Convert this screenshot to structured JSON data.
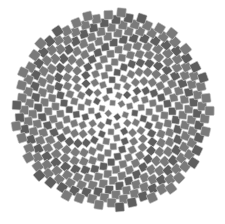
{
  "image": {
    "subject": "Sunflower seed head phyllotaxis pattern (Fibonacci spiral of square seeds)",
    "background_color": "#ffffff",
    "seed_fill_color": "#7a7a7a",
    "seed_dark_color": "#5e5e5e",
    "seed_edge_color": "#c8c8c8"
  },
  "pattern": {
    "center_x": 112,
    "center_y": 110,
    "outer_radius": 98,
    "seed_count": 380,
    "golden_angle_deg": 137.508,
    "seed_size_outer": 9.2,
    "seed_size_inner": 5.2
  }
}
